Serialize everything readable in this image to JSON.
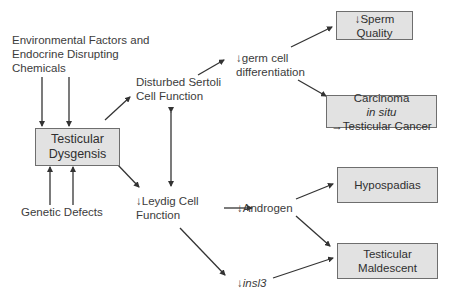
{
  "diagram": {
    "nodes": {
      "environmental": {
        "line1": "Environmental Factors and",
        "line2": "Endocrine Disrupting",
        "line3": "Chemicals"
      },
      "testicular_dysgenesis": {
        "line1": "Testicular",
        "line2": "Dysgensis"
      },
      "genetic_defects": {
        "label": "Genetic Defects"
      },
      "sertoli": {
        "line1": "Disturbed Sertoli",
        "line2": "Cell Function"
      },
      "leydig": {
        "arrow": "↓",
        "line1": "Leydig Cell",
        "line2": "Function"
      },
      "germ_cell": {
        "arrow": "↓",
        "line1": "germ cell",
        "line2": "differentiation"
      },
      "androgen": {
        "arrow": "↓",
        "label": "Androgen"
      },
      "insl3": {
        "arrow": "↓",
        "label": "insl3"
      },
      "sperm_quality": {
        "line1": "↓Sperm",
        "line2": "Quality"
      },
      "carcinoma": {
        "line1_a": "Carcinoma ",
        "line1_italic": "in situ",
        "line2": "→Testicular Cancer"
      },
      "hypospadias": {
        "label": "Hypospadias"
      },
      "maldescent": {
        "line1": "Testicular",
        "line2": "Maldescent"
      }
    },
    "edges": [
      {
        "from": "environmental",
        "to": "testicular_dysgenesis",
        "count": 2
      },
      {
        "from": "genetic_defects",
        "to": "testicular_dysgenesis",
        "count": 2
      },
      {
        "from": "testicular_dysgenesis",
        "to": "sertoli"
      },
      {
        "from": "testicular_dysgenesis",
        "to": "leydig"
      },
      {
        "from": "sertoli",
        "to": "leydig",
        "bidirectional": true
      },
      {
        "from": "sertoli",
        "to": "germ_cell"
      },
      {
        "from": "germ_cell",
        "to": "sperm_quality"
      },
      {
        "from": "germ_cell",
        "to": "carcinoma"
      },
      {
        "from": "leydig",
        "to": "androgen"
      },
      {
        "from": "leydig",
        "to": "insl3"
      },
      {
        "from": "androgen",
        "to": "hypospadias"
      },
      {
        "from": "androgen",
        "to": "maldescent"
      },
      {
        "from": "insl3",
        "to": "maldescent"
      }
    ],
    "colors": {
      "box_fill": "#e2e2e2",
      "box_border": "#6e6e6e",
      "arrow": "#333333",
      "text": "#3c3c3c"
    }
  }
}
